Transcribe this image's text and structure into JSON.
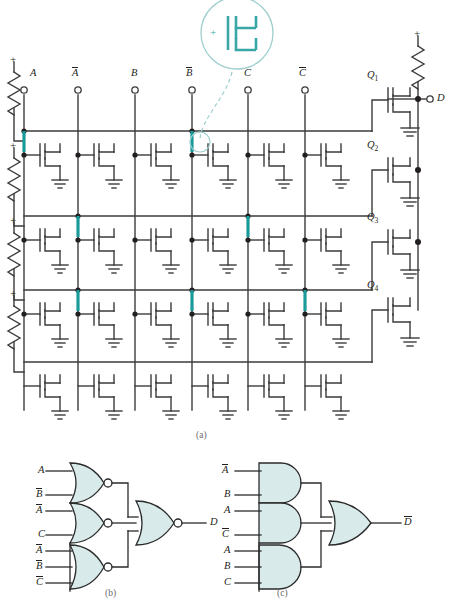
{
  "figure": {
    "panels": [
      {
        "id": "a",
        "label": "(a)",
        "caption_x": 196,
        "caption_y": 430
      },
      {
        "id": "b",
        "label": "(b)",
        "caption_x": 105,
        "caption_y": 588
      },
      {
        "id": "c",
        "label": "(c)",
        "caption_x": 277,
        "caption_y": 588
      }
    ]
  },
  "circuit": {
    "supply_marker": "+",
    "inputs": [
      {
        "name": "A",
        "overbar": false,
        "x": 24
      },
      {
        "name": "A",
        "overbar": true,
        "x": 78
      },
      {
        "name": "B",
        "overbar": false,
        "x": 135
      },
      {
        "name": "B",
        "overbar": true,
        "x": 192
      },
      {
        "name": "C",
        "overbar": false,
        "x": 248
      },
      {
        "name": "C",
        "overbar": true,
        "x": 305
      }
    ],
    "output_terminal": {
      "label": "D",
      "overbar": false,
      "x": 432,
      "y": 99
    },
    "output_transistors": [
      {
        "label": "Q",
        "subscript": "1",
        "y": 90
      },
      {
        "label": "Q",
        "subscript": "2",
        "y": 160
      },
      {
        "label": "Q",
        "subscript": "3",
        "y": 232
      },
      {
        "label": "Q",
        "subscript": "4",
        "y": 300
      }
    ],
    "rows": [
      {
        "index": 1,
        "y": 131,
        "programmed_columns": [
          1,
          4
        ]
      },
      {
        "index": 2,
        "y": 216,
        "programmed_columns": [
          2,
          5
        ]
      },
      {
        "index": 3,
        "y": 290,
        "programmed_columns": [
          2,
          4,
          6
        ]
      },
      {
        "index": 4,
        "y": 362,
        "programmed_columns": []
      }
    ],
    "callout": {
      "shape": "magnifier",
      "content": "mosfet-symbol",
      "plus": "+",
      "cx": 237,
      "cy": 33,
      "r": 36
    }
  },
  "logic_b": {
    "gate_type": "NOR",
    "gates": [
      {
        "inputs": [
          {
            "name": "A",
            "overbar": false
          },
          {
            "name": "B",
            "overbar": true
          }
        ]
      },
      {
        "inputs": [
          {
            "name": "A",
            "overbar": true
          },
          {
            "name": "C",
            "overbar": false
          }
        ]
      },
      {
        "inputs": [
          {
            "name": "A",
            "overbar": true
          },
          {
            "name": "B",
            "overbar": true
          },
          {
            "name": "C",
            "overbar": true
          }
        ]
      }
    ],
    "output_gate": {
      "type": "NOR"
    },
    "output": {
      "name": "D",
      "overbar": false
    }
  },
  "logic_c": {
    "gate_type": "AND",
    "gates": [
      {
        "inputs": [
          {
            "name": "A",
            "overbar": true
          },
          {
            "name": "B",
            "overbar": false
          }
        ]
      },
      {
        "inputs": [
          {
            "name": "A",
            "overbar": false
          },
          {
            "name": "C",
            "overbar": true
          }
        ]
      },
      {
        "inputs": [
          {
            "name": "A",
            "overbar": false
          },
          {
            "name": "B",
            "overbar": false
          },
          {
            "name": "C",
            "overbar": false
          }
        ]
      }
    ],
    "output_gate": {
      "type": "OR"
    },
    "output": {
      "name": "D",
      "overbar": true
    }
  },
  "colors": {
    "wire": "#3b3b3b",
    "program_link": "#1a9a9a",
    "callout_stroke": "#7fc5c5",
    "gate_fill": "#d8eaea",
    "gate_stroke": "#2b2b2b",
    "text": "#231f20",
    "caption": "#6d6a6b"
  }
}
